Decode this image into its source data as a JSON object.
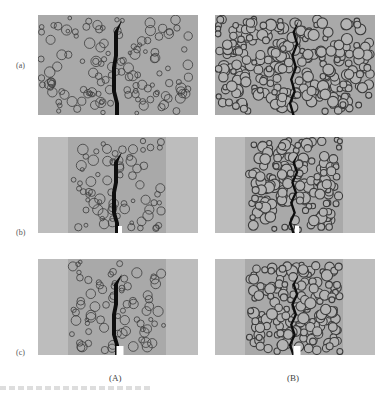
{
  "figure": {
    "row_labels": [
      "(a)",
      "(b)",
      "(c)"
    ],
    "column_labels": [
      "(A)",
      "(B)"
    ],
    "panels": [
      {
        "id": "a-A",
        "row": "(a)",
        "column": "(A)",
        "description": "sparse aggregate, full-width specimen, crack through middle",
        "aggregate_density": "sparse",
        "notch": false,
        "confined": false
      },
      {
        "id": "a-B",
        "row": "(a)",
        "column": "(B)",
        "description": "dense aggregate, full-width specimen, crack through middle",
        "aggregate_density": "dense",
        "notch": false,
        "confined": false
      },
      {
        "id": "b-A",
        "row": "(b)",
        "column": "(A)",
        "description": "sparse aggregate in central band, notched, crack from notch",
        "aggregate_density": "sparse",
        "notch": true,
        "confined": true
      },
      {
        "id": "b-B",
        "row": "(b)",
        "column": "(B)",
        "description": "dense aggregate in central band, notched, crack from notch",
        "aggregate_density": "dense",
        "notch": true,
        "confined": true
      },
      {
        "id": "c-A",
        "row": "(c)",
        "column": "(A)",
        "description": "sparse aggregate in central band, wider notch, crack from notch",
        "aggregate_density": "sparse",
        "notch": true,
        "confined": true
      },
      {
        "id": "c-B",
        "row": "(c)",
        "column": "(B)",
        "description": "dense aggregate in central band, wider notch, crack from notch",
        "aggregate_density": "dense",
        "notch": true,
        "confined": true
      }
    ],
    "colors": {
      "matrix": "#a9a9a9",
      "matrix_light": "#bdbdbd",
      "aggregate_stroke": "#3c3c3c",
      "crack": "#0e0e0e",
      "notch": "#ffffff"
    }
  }
}
